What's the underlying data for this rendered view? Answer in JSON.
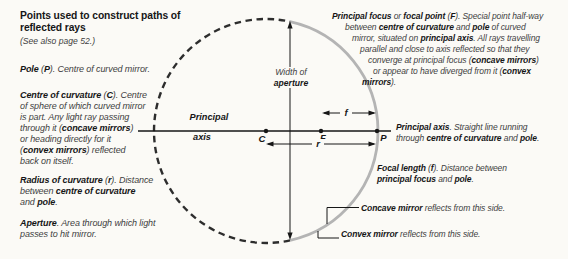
{
  "colors": {
    "bg": "#fbfaf6",
    "ink": "#161616",
    "body": "#3e3e3e",
    "arc": "#b4b4b4",
    "dash": "#2d2d2d"
  },
  "left_column": {
    "heading_lines": [
      "Points used to construct paths of",
      "reflected rays"
    ],
    "note": "(See also page 52.)",
    "pole_lines": [
      "**Pole** (**P**). Centre of curved mirror."
    ],
    "centre_lines": [
      "**Centre of curvature** (**C**). Centre",
      "of sphere of which curved mirror",
      "is part. Any light ray passing",
      "through it (**concave mirrors**)",
      "or heading directly for it",
      "(**convex mirrors**) reflected",
      "back on itself."
    ],
    "radius_lines": [
      "**Radius of curvature** (**r**). Distance",
      "between **centre of curvature**",
      "and **pole**."
    ],
    "aperture_lines": [
      "**Aperture**. Area through which light",
      "passes to hit mirror."
    ]
  },
  "right_column": {
    "focus_lines": [
      "**Principal focus** or **focal point** (**F**). Special point half-way",
      "between **centre of curvature** and **pole** of curved",
      "mirror, situated on **principal axis**. All rays travelling",
      "parallel and close to axis reflected so that they",
      "converge at principal focus (**concave mirrors**)",
      "or appear to have diverged from it (**convex**",
      "**mirrors**)."
    ],
    "principal_axis_lines": [
      "**Principal axis**. Straight line running",
      "through **centre of curvature** and **pole**."
    ],
    "focal_length_lines": [
      "**Focal length** (**f**). Distance between",
      "**principal focus** and **pole**."
    ],
    "concave_line": "**Concave mirror** reflects from this side.",
    "convex_line": "**Convex mirror** reflects from this side."
  },
  "diagram": {
    "aperture_label_line1": "Width of",
    "aperture_label_line2": "aperture",
    "axis_label_line1": "Principal",
    "axis_label_line2": "axis",
    "point_c": "C",
    "point_f": "F",
    "point_p": "P",
    "focal_length_symbol": "f",
    "radius_symbol": "r"
  }
}
